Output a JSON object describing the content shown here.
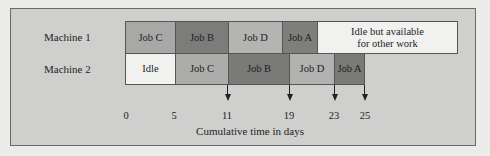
{
  "diagram": {
    "type": "gantt",
    "rows": [
      {
        "label": "Machine 1",
        "tasks": [
          {
            "label": "Job C",
            "start": 0,
            "end": 5,
            "color": "#a8a8a6"
          },
          {
            "label": "Job B",
            "start": 5,
            "end": 11,
            "color": "#7c7c7a"
          },
          {
            "label": "Job D",
            "start": 11,
            "end": 16.5,
            "color": "#b4b4b2"
          },
          {
            "label": "Job A",
            "start": 16.5,
            "end": 19.7,
            "color": "#7e7e7c"
          },
          {
            "label": "Idle but available\nfor other work",
            "start": 19.7,
            "end": 33,
            "color": "#f1f1ef"
          }
        ]
      },
      {
        "label": "Machine 2",
        "tasks": [
          {
            "label": "Idle",
            "start": 0,
            "end": 5,
            "color": "#f1f1ef"
          },
          {
            "label": "Job C",
            "start": 5,
            "end": 11,
            "color": "#acacaa"
          },
          {
            "label": "Job B",
            "start": 11,
            "end": 19,
            "color": "#7a7a78"
          },
          {
            "label": "Job D",
            "start": 19,
            "end": 23,
            "color": "#b2b2b0"
          },
          {
            "label": "Job A",
            "start": 23,
            "end": 25,
            "color": "#7a7a78"
          }
        ]
      }
    ],
    "ticks": [
      "0",
      "5",
      "11",
      "19",
      "23",
      "25"
    ],
    "arrow_ticks": [
      "11",
      "19",
      "23",
      "25"
    ],
    "axis_label": "Cumulative time in days"
  }
}
